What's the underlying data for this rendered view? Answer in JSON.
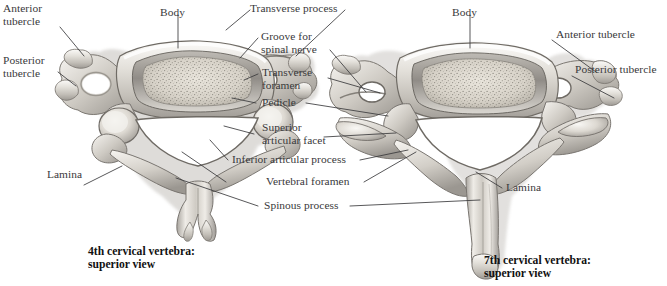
{
  "figure": {
    "title_left": "4th cervical vertebra:\nsuperior view",
    "title_right": "7th cervical vertebra:\nsuperior view",
    "background_color": "#ffffff",
    "label_color": "#39393b",
    "caption_color": "#111111",
    "leader_color": "#3a3a3c",
    "bone_light": "#f2f0ec",
    "bone_mid": "#c9c6c0",
    "bone_dark": "#8e8b86",
    "bone_shadow": "#6d6a66"
  },
  "labels": {
    "anterior_tubercle_left": "Anterior\ntubercle",
    "posterior_tubercle_left": "Posterior\ntubercle",
    "body_left": "Body",
    "transverse_process": "Transverse process",
    "groove_for_spinal_nerve": "Groove for\nspinal nerve",
    "transverse_foramen": "Transverse\nforamen",
    "pedicle": "Pedicle",
    "superior_articular_facet": "Superior\narticular facet",
    "inferior_articular_process": "Inferior articular process",
    "vertebral_foramen": "Vertebral foramen",
    "spinous_process": "Spinous process",
    "lamina_left": "Lamina",
    "lamina_right": "Lamina",
    "body_right": "Body",
    "anterior_tubercle_right": "Anterior tubercle",
    "posterior_tubercle_right": "Posterior tubercle"
  }
}
